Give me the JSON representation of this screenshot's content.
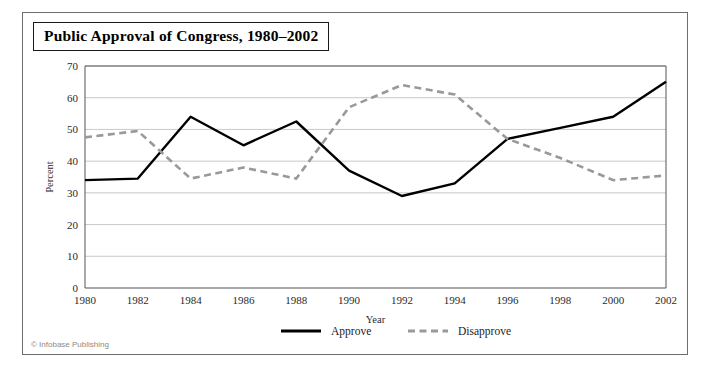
{
  "figure": {
    "title": "Public Approval of Congress, 1980–2002",
    "credit": "© Infobase Publishing"
  },
  "colors": {
    "approve_line": "#000000",
    "disapprove_line": "#999999",
    "gridline": "#c9c9c9",
    "axis": "#555555",
    "frame_border": "#6e6e6e",
    "title_border": "#1a1a1a",
    "background": "#ffffff",
    "credit_text": "#8a8a8a"
  },
  "chart_data": {
    "type": "line",
    "title": "Public Approval of Congress, 1980–2002",
    "xlabel": "Year",
    "ylabel": "Percent",
    "categories": [
      1980,
      1982,
      1984,
      1986,
      1988,
      1990,
      1992,
      1994,
      1996,
      1998,
      2000,
      2002
    ],
    "x": [
      1980,
      1982,
      1984,
      1986,
      1988,
      1990,
      1992,
      1994,
      1996,
      1998,
      2000,
      2002
    ],
    "xtick_labels": [
      "1980",
      "1982",
      "1984",
      "1986",
      "1988",
      "1990",
      "1992",
      "1994",
      "1996",
      "1998",
      "2000",
      "2002"
    ],
    "ytick_labels": [
      "0",
      "10",
      "20",
      "30",
      "40",
      "50",
      "60",
      "70"
    ],
    "yticks": [
      0,
      10,
      20,
      30,
      40,
      50,
      60,
      70
    ],
    "xlim": [
      1980,
      2002
    ],
    "ylim": [
      0,
      70
    ],
    "grid": true,
    "legend_position": "bottom",
    "series": [
      {
        "name": "Approve",
        "style": "solid",
        "color": "#000000",
        "values": [
          34,
          34.5,
          54,
          45,
          52.5,
          37,
          29,
          33,
          47,
          50.5,
          54,
          65
        ]
      },
      {
        "name": "Disapprove",
        "style": "dashed",
        "color": "#999999",
        "values": [
          47.5,
          49.5,
          34.5,
          38,
          34.5,
          57,
          64,
          61,
          47,
          41,
          34,
          35.5
        ]
      }
    ]
  },
  "legend": {
    "items": [
      {
        "label": "Approve",
        "style": "solid"
      },
      {
        "label": "Disapprove",
        "style": "dashed"
      }
    ]
  }
}
